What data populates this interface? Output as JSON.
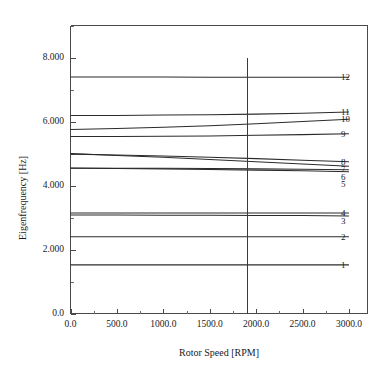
{
  "chart_data": {
    "type": "line",
    "title": "",
    "xlabel": "Rotor Speed [RPM]",
    "ylabel": "Eigenfrequency [Hz]",
    "xlim": [
      0,
      3200
    ],
    "ylim": [
      0,
      9.0
    ],
    "grid": false,
    "legend": "right-of-axes-curve-labels",
    "xticks": [
      0,
      500,
      1000,
      1500,
      2000,
      2500,
      3000
    ],
    "xtick_labels": [
      "0.0",
      "500.0",
      "1000.0",
      "1500.0",
      "2000.0",
      "2500.0",
      "3000.0"
    ],
    "yticks": [
      0,
      2,
      4,
      6,
      8
    ],
    "ytick_labels": [
      "0.0",
      "2.000",
      "4.000",
      "6.000",
      "8.000"
    ],
    "yticks_minor": [
      1,
      3,
      5,
      7,
      9
    ],
    "x": [
      0,
      500,
      1000,
      1500,
      2000,
      2500,
      3000
    ],
    "annotations": [
      {
        "name": "operating-speed-line",
        "type": "vline",
        "x": 1900,
        "y_from": 0.0,
        "y_to": 8.0,
        "label": ""
      }
    ],
    "series": [
      {
        "name": "1",
        "label": "1",
        "values": [
          1.52,
          1.52,
          1.52,
          1.52,
          1.52,
          1.52,
          1.52
        ]
      },
      {
        "name": "2",
        "label": "2",
        "values": [
          2.4,
          2.4,
          2.4,
          2.4,
          2.4,
          2.4,
          2.4
        ]
      },
      {
        "name": "3",
        "label": "3",
        "values": [
          3.08,
          3.08,
          3.07,
          3.07,
          3.06,
          3.06,
          3.05
        ]
      },
      {
        "name": "4",
        "label": "4",
        "values": [
          3.14,
          3.14,
          3.14,
          3.14,
          3.14,
          3.14,
          3.14
        ]
      },
      {
        "name": "5",
        "label": "5",
        "values": [
          4.54,
          4.53,
          4.52,
          4.5,
          4.48,
          4.46,
          4.43
        ]
      },
      {
        "name": "6",
        "label": "6",
        "values": [
          4.55,
          4.54,
          4.54,
          4.53,
          4.52,
          4.51,
          4.49
        ]
      },
      {
        "name": "7",
        "label": "7",
        "values": [
          5.0,
          4.94,
          4.88,
          4.81,
          4.74,
          4.67,
          4.6
        ]
      },
      {
        "name": "8",
        "label": "8",
        "values": [
          4.98,
          4.95,
          4.92,
          4.88,
          4.84,
          4.79,
          4.74
        ]
      },
      {
        "name": "9",
        "label": "9",
        "values": [
          5.53,
          5.53,
          5.54,
          5.55,
          5.57,
          5.59,
          5.62
        ]
      },
      {
        "name": "10",
        "label": "10",
        "values": [
          5.75,
          5.78,
          5.82,
          5.87,
          5.93,
          6.0,
          6.07
        ]
      },
      {
        "name": "11",
        "label": "11",
        "values": [
          6.19,
          6.19,
          6.2,
          6.21,
          6.23,
          6.26,
          6.3
        ]
      },
      {
        "name": "12",
        "label": "12",
        "values": [
          7.39,
          7.39,
          7.39,
          7.38,
          7.38,
          7.38,
          7.38
        ]
      }
    ]
  }
}
